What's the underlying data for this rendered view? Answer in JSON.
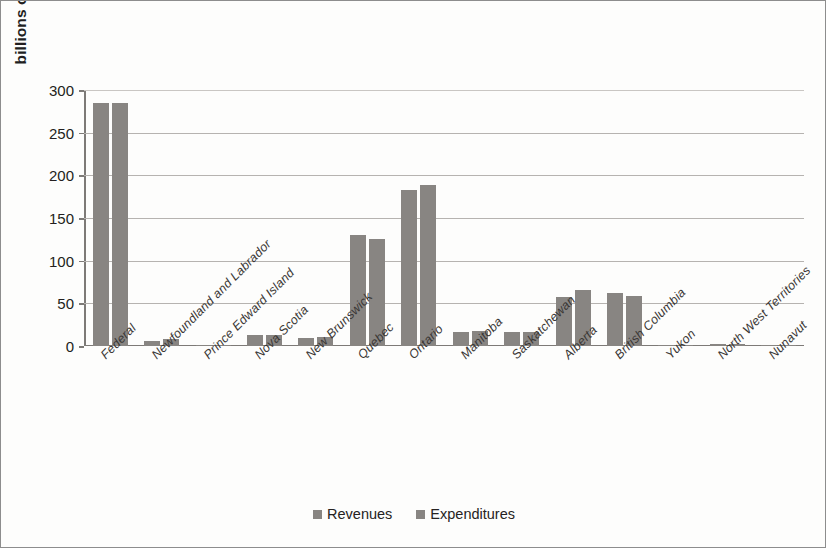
{
  "chart_data": {
    "type": "bar",
    "title": "",
    "xlabel": "",
    "ylabel": "billions of current $ Cnd",
    "ylim": [
      0,
      300
    ],
    "ytick_labels": [
      "300",
      "250",
      "200",
      "150",
      "100",
      "50",
      "0"
    ],
    "ytick_values": [
      300,
      250,
      200,
      150,
      100,
      50,
      0
    ],
    "grid": true,
    "legend_position": "bottom-center",
    "categories": [
      "Federal",
      "Newfoundland and Labrador",
      "Prince Edward Island",
      "Nova Scotia",
      "New Brunswick",
      "Quebec",
      "Ontario",
      "Manitoba",
      "Saskatchewan",
      "Alberta",
      "British Columbia",
      "Yukon",
      "North West Territories",
      "Nunavut"
    ],
    "series": [
      {
        "name": "Revenues",
        "color": "#888582",
        "values": [
          285,
          6,
          1.5,
          13,
          9,
          130,
          183,
          17,
          16,
          58,
          62,
          1,
          2,
          1.5
        ]
      },
      {
        "name": "Expenditures",
        "color": "#888582",
        "values": [
          285,
          8,
          1.5,
          13,
          10,
          125,
          189,
          18,
          16,
          66,
          59,
          1,
          2,
          1.5
        ]
      }
    ]
  }
}
